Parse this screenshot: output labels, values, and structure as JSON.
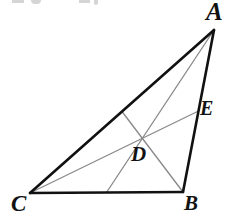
{
  "figure": {
    "name": "triangle-with-medians",
    "width": 228,
    "height": 217,
    "background_color": "#ffffff",
    "outline_color": "#111111",
    "cevian_color": "#8a8a8a",
    "outline_width": 2.6,
    "cevian_width": 1.35
  },
  "points": {
    "A": {
      "label": "A",
      "x": 214,
      "y": 30
    },
    "B": {
      "label": "B",
      "x": 183,
      "y": 192
    },
    "C": {
      "label": "C",
      "x": 30,
      "y": 193
    },
    "D": {
      "label": "D",
      "x": 140,
      "y": 134
    },
    "E": {
      "label": "E",
      "x": 198.5,
      "y": 111
    },
    "F": {
      "label": "",
      "x": 106.5,
      "y": 192.5
    },
    "G": {
      "label": "",
      "x": 122,
      "y": 111.5
    }
  },
  "sides": [
    {
      "name": "side-CA",
      "from": "C",
      "to": "A"
    },
    {
      "name": "side-AB",
      "from": "A",
      "to": "B"
    },
    {
      "name": "side-CB",
      "from": "C",
      "to": "B"
    }
  ],
  "cevians": [
    {
      "name": "median-C-to-E",
      "from": "C",
      "to": "E"
    },
    {
      "name": "median-A-to-F",
      "from": "A",
      "to": "F"
    },
    {
      "name": "median-G-to-B",
      "from": "G",
      "to": "B"
    }
  ],
  "crop_artifacts": {
    "present": true,
    "note": "faint cut-off glyph bottoms along the top edge"
  }
}
